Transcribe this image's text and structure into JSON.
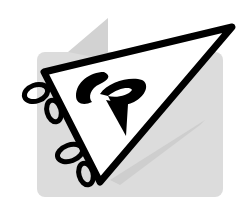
{
  "logo": {
    "name": "CP pennant logo",
    "monogram": "CP",
    "colors": {
      "background": "#ffffff",
      "panel": "#dcdcdc",
      "shadow": "#c4c4c4",
      "ink": "#000000",
      "pennant_fill": "#ffffff"
    }
  }
}
